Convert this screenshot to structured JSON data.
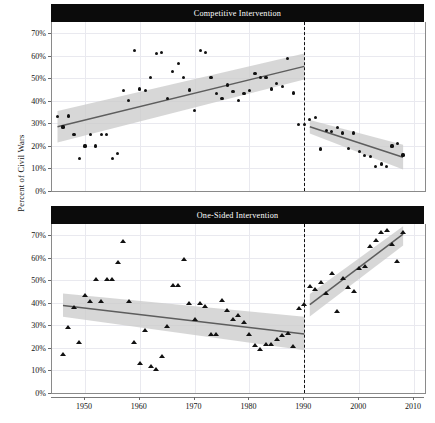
{
  "figure": {
    "ylabel": "Percent of Civil Wars",
    "xlabel": "",
    "x_ticks": [
      1950,
      1960,
      1970,
      1980,
      1990,
      2000,
      2010
    ],
    "x_tick_labels": [
      "1950",
      "1960",
      "1970",
      "1980",
      "1990",
      "2010ph",
      "2010"
    ],
    "y_ticks": [
      0,
      10,
      20,
      30,
      40,
      50,
      60,
      70
    ],
    "y_tick_labels": [
      "0%",
      "10%",
      "20%",
      "30%",
      "40%",
      "50%",
      "60%",
      "70%"
    ],
    "colors": {
      "strip_background": "#0b0b0b",
      "strip_text": "#ffffff",
      "point": "#111111",
      "trend_line": "#5d5d5d",
      "confidence_band": "#c9c9c9",
      "grid": "#e9e9ef",
      "break_line": "#111111"
    },
    "panel_titles": [
      "Competitive Intervention",
      "One-Sided Intervention"
    ]
  },
  "chart_data": [
    {
      "type": "scatter",
      "title": "Competitive Intervention",
      "xlabel": "",
      "ylabel": "Percent of Civil Wars",
      "xlim": [
        1944,
        2012
      ],
      "ylim": [
        0,
        75
      ],
      "grid": true,
      "legend": "none",
      "marker": "circle",
      "annotations": [
        {
          "type": "vertical-dashed-line",
          "x": 1990,
          "label": "Cold War end structural break"
        }
      ],
      "x": [
        1945,
        1946,
        1947,
        1948,
        1949,
        1950,
        1951,
        1952,
        1953,
        1954,
        1955,
        1956,
        1957,
        1958,
        1959,
        1960,
        1961,
        1962,
        1963,
        1964,
        1965,
        1966,
        1967,
        1968,
        1969,
        1970,
        1971,
        1972,
        1973,
        1974,
        1975,
        1976,
        1977,
        1978,
        1979,
        1980,
        1981,
        1982,
        1983,
        1984,
        1985,
        1986,
        1987,
        1988,
        1989,
        1990,
        1991,
        1992,
        1993,
        1994,
        1995,
        1996,
        1997,
        1998,
        1999,
        2000,
        2001,
        2002,
        2003,
        2004,
        2005,
        2006,
        2007,
        2008
      ],
      "y": [
        33.2,
        28.4,
        33.3,
        25.0,
        14.5,
        20.0,
        25.0,
        20.0,
        25.0,
        25.0,
        14.6,
        16.8,
        44.5,
        40.2,
        62.5,
        45.3,
        44.5,
        50.3,
        61.0,
        61.6,
        41.0,
        53.0,
        56.7,
        50.3,
        44.8,
        35.6,
        62.3,
        61.4,
        50.3,
        43.4,
        41.2,
        47.0,
        44.2,
        40.0,
        43.3,
        44.6,
        52.2,
        50.5,
        50.4,
        45.3,
        47.7,
        46.5,
        58.7,
        43.5,
        29.6,
        29.4,
        31.8,
        32.6,
        18.6,
        26.8,
        26.3,
        28.2,
        25.7,
        18.9,
        25.7,
        17.5,
        15.8,
        15.4,
        11.0,
        12.0,
        11.0,
        20.0,
        21.0,
        16.0
      ],
      "segments": [
        {
          "name": "Cold War (1945-1990)",
          "x_range": [
            1945,
            1990
          ],
          "trend_start_y": 28.5,
          "trend_end_y": 55.3,
          "band_start": [
            21.5,
            35.5
          ],
          "band_end": [
            49.5,
            61.0
          ]
        },
        {
          "name": "Post-Cold War (1991-2008)",
          "x_range": [
            1991,
            2008
          ],
          "trend_start_y": 28.5,
          "trend_end_y": 15.0,
          "band_start": [
            25.5,
            31.5
          ],
          "band_end": [
            9.5,
            20.5
          ]
        }
      ]
    },
    {
      "type": "scatter",
      "title": "One-Sided Intervention",
      "xlabel": "",
      "ylabel": "Percent of Civil Wars",
      "xlim": [
        1944,
        2012
      ],
      "ylim": [
        0,
        75
      ],
      "grid": true,
      "legend": "none",
      "marker": "triangle",
      "annotations": [
        {
          "type": "vertical-dashed-line",
          "x": 1990,
          "label": "Cold War end structural break"
        }
      ],
      "x": [
        1946,
        1947,
        1948,
        1949,
        1950,
        1951,
        1952,
        1953,
        1954,
        1955,
        1956,
        1957,
        1958,
        1959,
        1960,
        1961,
        1962,
        1963,
        1964,
        1965,
        1966,
        1967,
        1968,
        1969,
        1970,
        1971,
        1972,
        1973,
        1974,
        1975,
        1976,
        1977,
        1978,
        1979,
        1980,
        1981,
        1982,
        1983,
        1984,
        1985,
        1986,
        1987,
        1988,
        1989,
        1990,
        1991,
        1992,
        1993,
        1994,
        1995,
        1996,
        1997,
        1998,
        1999,
        2000,
        2001,
        2002,
        2003,
        2004,
        2005,
        2006,
        2007,
        2008
      ],
      "y": [
        16.8,
        28.9,
        37.6,
        22.4,
        43.2,
        40.3,
        50.2,
        40.5,
        50.2,
        50.2,
        57.5,
        66.8,
        40.4,
        22.4,
        12.9,
        27.7,
        11.5,
        10.4,
        15.8,
        29.2,
        47.3,
        47.6,
        59.2,
        39.5,
        32.2,
        39.5,
        38.1,
        25.8,
        25.9,
        41.0,
        36.5,
        32.5,
        34.0,
        31.0,
        25.7,
        21.0,
        19.0,
        21.4,
        21.3,
        23.6,
        25.3,
        26.1,
        20.2,
        37.2,
        39.0,
        47.2,
        45.9,
        48.6,
        43.9,
        52.9,
        35.8,
        50.8,
        46.5,
        44.9,
        55.2,
        55.7,
        65.0,
        67.3,
        70.8,
        72.0,
        65.8,
        58.3,
        70.8
      ],
      "segments": [
        {
          "name": "Cold War (1946-1990)",
          "x_range": [
            1946,
            1990
          ],
          "trend_start_y": 38.8,
          "trend_end_y": 26.2,
          "band_start": [
            33.8,
            44.2
          ],
          "band_end": [
            19.0,
            33.8
          ]
        },
        {
          "name": "Post-Cold War (1991-2008)",
          "x_range": [
            1991,
            2008
          ],
          "trend_start_y": 39.2,
          "trend_end_y": 70.5,
          "band_start": [
            34.0,
            44.0
          ],
          "band_end": [
            65.5,
            74.0
          ]
        }
      ]
    }
  ]
}
